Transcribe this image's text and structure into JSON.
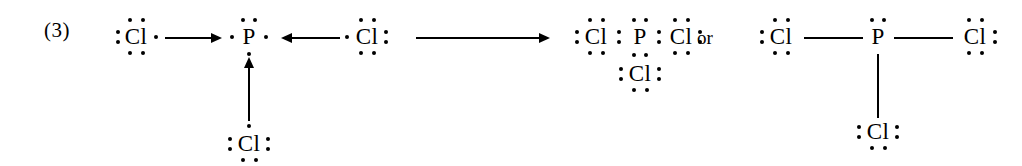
{
  "diagram": {
    "type": "lewis-dot-structure-reaction",
    "item_number": "(3)",
    "connector_word": "or",
    "reaction_summary": "3 Cl atoms + 1 P atom form PCl3",
    "reactants": {
      "chlorine_left": {
        "symbol": "Cl",
        "dots": {
          "top": 2,
          "left": 2,
          "bottom": 2,
          "right": 1
        },
        "valence_electrons": 7
      },
      "phosphorus_center": {
        "symbol": "P",
        "dots": {
          "top": 2,
          "left": 1,
          "bottom": 1,
          "right": 1
        },
        "valence_electrons": 5
      },
      "chlorine_right": {
        "symbol": "Cl",
        "dots": {
          "top": 2,
          "left": 1,
          "bottom": 2,
          "right": 2
        },
        "valence_electrons": 7
      },
      "chlorine_bottom": {
        "symbol": "Cl",
        "dots": {
          "top": 1,
          "left": 2,
          "bottom": 2,
          "right": 2
        },
        "valence_electrons": 7
      }
    },
    "product_dot_form": {
      "label": "PCl3 Lewis dot structure",
      "phosphorus": {
        "symbol": "P",
        "dots": {
          "top": 2
        }
      },
      "chlorine_left": {
        "symbol": "Cl",
        "dots": {
          "top": 2,
          "left": 2,
          "bottom": 2
        }
      },
      "chlorine_right": {
        "symbol": "Cl",
        "dots": {
          "top": 2,
          "right": 2,
          "bottom": 2
        }
      },
      "chlorine_bottom": {
        "symbol": "Cl",
        "dots": {
          "left": 2,
          "right": 2,
          "bottom": 2
        }
      },
      "bonding_pairs": [
        {
          "between": "Cl-left and P",
          "dots": 2
        },
        {
          "between": "P and Cl-right",
          "dots": 2
        },
        {
          "between": "P and Cl-bottom",
          "dots": 2
        }
      ]
    },
    "product_line_form": {
      "label": "PCl3 structural formula",
      "phosphorus": {
        "symbol": "P",
        "dots": {
          "top": 2
        }
      },
      "chlorine_left": {
        "symbol": "Cl",
        "dots": {
          "top": 2,
          "left": 2,
          "bottom": 2
        }
      },
      "chlorine_right": {
        "symbol": "Cl",
        "dots": {
          "top": 2,
          "right": 2,
          "bottom": 2
        }
      },
      "chlorine_bottom": {
        "symbol": "Cl",
        "dots": {
          "left": 2,
          "right": 2,
          "bottom": 2
        }
      },
      "bonds": [
        {
          "between": "Cl-left and P",
          "type": "single-line"
        },
        {
          "between": "P and Cl-right",
          "type": "single-line"
        },
        {
          "between": "P and Cl-bottom",
          "type": "single-line"
        }
      ]
    },
    "arrows": [
      {
        "name": "arrow-cl-left-to-p",
        "direction": "right"
      },
      {
        "name": "arrow-cl-right-to-p",
        "direction": "left"
      },
      {
        "name": "arrow-cl-bottom-to-p",
        "direction": "up"
      },
      {
        "name": "arrow-reaction",
        "direction": "right"
      }
    ],
    "colors": {
      "ink": "#000000",
      "background": "#ffffff"
    }
  }
}
